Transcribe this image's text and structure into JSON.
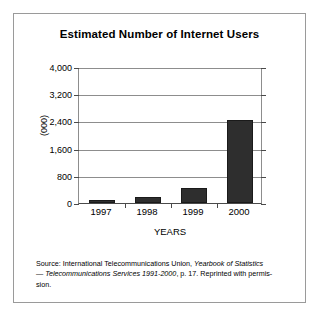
{
  "figure": {
    "title": "Estimated Number of Internet Users",
    "source_note": {
      "line1_prefix": "Source: International Telecommunications Union, ",
      "line1_italic": "Yearbook of Statistics",
      "line2_dash": "— ",
      "line2_italic": "Telecommunications Services 1991-2000",
      "line2_suffix": ", p. 17. Reprinted with permis-",
      "line3": "sion."
    }
  },
  "chart_data": {
    "type": "bar",
    "title": "Estimated Number of Internet Users",
    "xlabel": "YEARS",
    "ylabel": "(000)",
    "categories": [
      "1997",
      "1998",
      "1999",
      "2000"
    ],
    "values": [
      90,
      180,
      440,
      2450
    ],
    "ylim": [
      0,
      4000
    ],
    "yticks": [
      0,
      800,
      1600,
      2400,
      3200,
      4000
    ],
    "ytick_labels": [
      "0",
      "800",
      "1,600",
      "2,400",
      "3,200",
      "4,000"
    ],
    "grid": true,
    "legend": false,
    "bar_color": "#2e2e2e",
    "grid_color": "#8d8d8d",
    "axis_color": "#4a4a4a",
    "frame_color": "#9a9a9a"
  }
}
